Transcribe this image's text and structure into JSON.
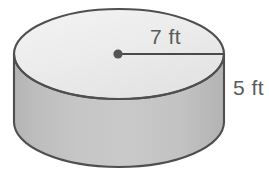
{
  "figure": {
    "kind": "cylinder-diagram",
    "units": "ft",
    "canvas": {
      "width": 269,
      "height": 180
    },
    "background_color": "#ffffff"
  },
  "labels": {
    "radius": "7 ft",
    "height": "5 ft"
  },
  "measurements": {
    "radius_value": 7,
    "radius_unit": "ft",
    "height_value": 5,
    "height_unit": "ft"
  },
  "colors": {
    "top_face": "#ededed",
    "top_face_edge": "#f6f6f6",
    "body": "#c0c0c0",
    "body_highlight": "#cfcfcf",
    "body_shadow": "#b2b2b2",
    "outline": "#4f4f4f",
    "hidden_line": "#5a5a5a",
    "label_text": "#5a5a5a",
    "center_dot": "#555555",
    "radius_line": "#4a4a4a"
  },
  "geometry": {
    "center_x": 119,
    "radius_x": 105,
    "top_center_y": 54,
    "bottom_center_y": 122,
    "ellipse_ry": 45,
    "left_x": 14,
    "right_x": 224,
    "center_dot_x": 118,
    "center_dot_y": 54,
    "center_dot_r": 4.5,
    "radius_line_end_x": 224,
    "radius_label_x": 150,
    "radius_label_y": 44,
    "height_label_x": 233,
    "height_label_y": 95
  },
  "parts": {
    "top_face_name": "top circular face",
    "lateral_face_name": "lateral curved surface",
    "hidden_edge_name": "hidden back edge of base",
    "visible_edge_name": "visible front edge of base",
    "radius_segment_name": "radius segment",
    "center_point_name": "center point of top face"
  }
}
